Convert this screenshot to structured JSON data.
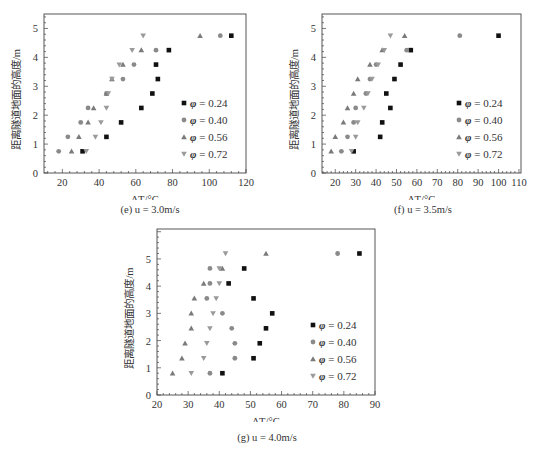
{
  "chart_data": [
    {
      "id": "e",
      "type": "scatter",
      "title": "(e) u = 3.0m/s",
      "xlabel": "ΔT/°C",
      "ylabel": "距离隧道地面的高度/m",
      "xlim": [
        10,
        120
      ],
      "ylim": [
        0,
        5.5
      ],
      "xticks": [
        20,
        40,
        60,
        80,
        100,
        120
      ],
      "yticks": [
        0,
        1,
        2,
        3,
        4,
        5
      ],
      "grid": false,
      "legend_position": "lower right",
      "y": [
        0.75,
        1.25,
        1.75,
        2.25,
        2.75,
        3.25,
        3.75,
        4.25,
        4.75
      ],
      "series": [
        {
          "name": "φ = 0.24",
          "marker": "square",
          "x": [
            31,
            44,
            52,
            63,
            69,
            72,
            71,
            78,
            112
          ]
        },
        {
          "name": "φ = 0.40",
          "marker": "circle",
          "x": [
            18,
            23,
            30,
            34,
            44,
            53,
            59,
            71,
            106
          ]
        },
        {
          "name": "φ = 0.56",
          "marker": "triangle-up",
          "x": [
            25,
            29,
            34,
            37,
            44,
            47,
            53,
            63,
            95
          ]
        },
        {
          "name": "φ = 0.72",
          "marker": "triangle-down",
          "x": [
            33,
            38,
            41,
            44,
            45,
            47,
            51,
            58,
            64
          ]
        }
      ]
    },
    {
      "id": "f",
      "type": "scatter",
      "title": "(f) u = 3.5m/s",
      "xlabel": "ΔT/°C",
      "ylabel": "距离隧道地面的高度/m",
      "xlim": [
        13.5,
        111
      ],
      "ylim": [
        0,
        5.5
      ],
      "xticks": [
        20,
        30,
        40,
        50,
        60,
        70,
        80,
        90,
        100,
        110
      ],
      "yticks": [
        0,
        1,
        2,
        3,
        4,
        5
      ],
      "grid": false,
      "legend_position": "lower right",
      "y": [
        0.75,
        1.25,
        1.75,
        2.25,
        2.75,
        3.25,
        3.75,
        4.25,
        4.75
      ],
      "series": [
        {
          "name": "φ = 0.24",
          "marker": "square",
          "x": [
            29,
            42,
            43,
            47,
            45,
            49,
            52,
            57,
            100
          ]
        },
        {
          "name": "φ = 0.40",
          "marker": "circle",
          "x": [
            23,
            26,
            29,
            30,
            35,
            37,
            40,
            55,
            81
          ]
        },
        {
          "name": "φ = 0.56",
          "marker": "triangle-up",
          "x": [
            18,
            20,
            24,
            26,
            29,
            31,
            37,
            43,
            54
          ]
        },
        {
          "name": "φ = 0.72",
          "marker": "triangle-down",
          "x": [
            28,
            30,
            31,
            34,
            36,
            38,
            41,
            44,
            47
          ]
        }
      ]
    },
    {
      "id": "g",
      "type": "scatter",
      "title": "(g) u = 4.0m/s",
      "xlabel": "ΔT/°C",
      "ylabel": "距离隧道地面的高度/m",
      "xlim": [
        20,
        90
      ],
      "ylim": [
        0,
        6.1
      ],
      "xticks": [
        20,
        30,
        40,
        50,
        60,
        70,
        80,
        90
      ],
      "yticks": [
        0,
        1,
        2,
        3,
        4,
        5
      ],
      "grid": false,
      "legend_position": "lower right",
      "y": [
        0.8,
        1.35,
        1.9,
        2.45,
        3.0,
        3.55,
        4.1,
        4.65,
        5.2
      ],
      "series": [
        {
          "name": "φ = 0.24",
          "marker": "square",
          "x": [
            41,
            51,
            53,
            55,
            57,
            51,
            43,
            48,
            85
          ]
        },
        {
          "name": "φ = 0.40",
          "marker": "circle",
          "x": [
            37,
            45,
            45,
            44,
            41,
            36,
            37,
            37,
            78
          ]
        },
        {
          "name": "φ = 0.56",
          "marker": "triangle-up",
          "x": [
            25,
            28,
            29,
            31,
            31,
            32,
            35,
            41,
            55
          ]
        },
        {
          "name": "φ = 0.72",
          "marker": "triangle-down",
          "x": [
            31,
            35,
            36,
            37,
            38,
            39,
            40,
            40,
            42
          ]
        }
      ]
    }
  ],
  "captions": {
    "e": "(e) u = 3.0m/s",
    "f": "(f) u = 3.5m/s",
    "g": "(g) u = 4.0m/s"
  },
  "colors": {
    "phi_024": "#111111",
    "phi_040": "#8a8a8a",
    "phi_056": "#7a7a7a",
    "phi_072": "#9a9a9a",
    "axis": "#444444"
  }
}
